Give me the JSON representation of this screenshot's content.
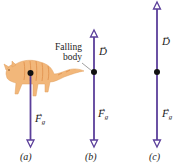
{
  "figure": {
    "annotation": {
      "line1": "Falling",
      "line2": "body"
    },
    "panels": [
      {
        "id": "a",
        "caption": "(a)",
        "vectors": [
          {
            "symbol": "F",
            "subscript": "g",
            "direction": "down"
          }
        ],
        "subject": "cat"
      },
      {
        "id": "b",
        "caption": "(b)",
        "vectors": [
          {
            "symbol": "D",
            "subscript": "",
            "direction": "up"
          },
          {
            "symbol": "F",
            "subscript": "g",
            "direction": "down"
          }
        ]
      },
      {
        "id": "c",
        "caption": "(c)",
        "vectors": [
          {
            "symbol": "D",
            "subscript": "",
            "direction": "up"
          },
          {
            "symbol": "F",
            "subscript": "g",
            "direction": "down"
          }
        ]
      }
    ],
    "arrow_glyph": "→",
    "colors": {
      "vector": "#5b3f9a",
      "dot": "#111111",
      "cat": "#f2b77a",
      "cat_stripes": "#e08f4a",
      "leader": "#777777"
    }
  }
}
